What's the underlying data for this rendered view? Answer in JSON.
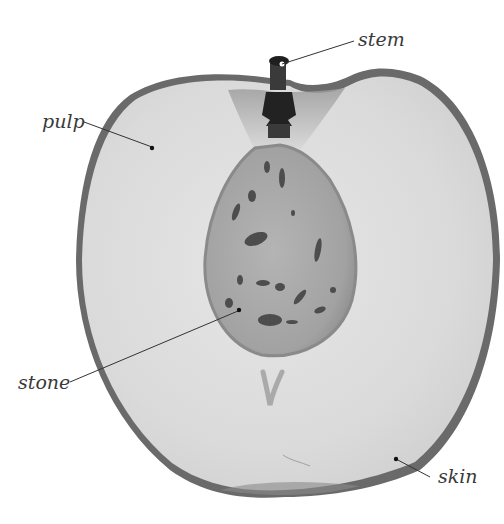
{
  "diagram": {
    "labels": [
      {
        "id": "stem",
        "text": "stem"
      },
      {
        "id": "pulp",
        "text": "pulp"
      },
      {
        "id": "stone",
        "text": "stone"
      },
      {
        "id": "skin",
        "text": "skin"
      }
    ]
  },
  "colors": {
    "background": "#ffffff",
    "skin": "#6a6a6a",
    "pulp": "#dcdcdc",
    "stone": "#a6a6a6",
    "stone_pits": "#4a4a4a",
    "stem": "#2a2a2a",
    "leader_line": "#333333"
  }
}
